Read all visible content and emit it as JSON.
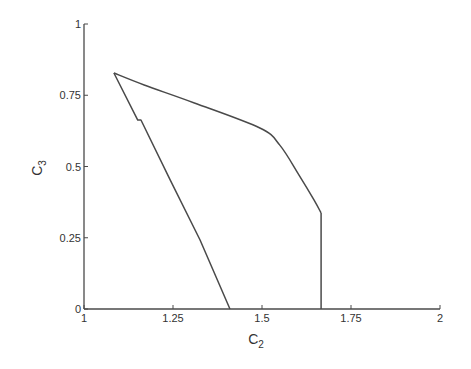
{
  "chart_data": {
    "type": "line",
    "title": "",
    "xlabel": "C2",
    "xlabel_main": "C",
    "xlabel_sub": "2",
    "ylabel": "C3",
    "ylabel_main": "C",
    "ylabel_sub": "3",
    "xlim": [
      1,
      2
    ],
    "ylim": [
      0,
      1
    ],
    "grid": false,
    "legend": null,
    "x_ticks": [
      1,
      1.25,
      1.5,
      1.75,
      2
    ],
    "x_tick_labels": [
      "1",
      "1.25",
      "1.5",
      "1.75",
      "2"
    ],
    "y_ticks": [
      0,
      0.25,
      0.5,
      0.75,
      1
    ],
    "y_tick_labels": [
      "0",
      "0.25",
      "0.5",
      "0.75",
      "1"
    ],
    "series": [
      {
        "name": "lower-left boundary",
        "x": [
          1.41,
          1.326,
          1.242,
          1.242,
          1.16,
          1.151,
          1.084
        ],
        "y": [
          0.0,
          0.242,
          0.453,
          0.453,
          0.663,
          0.663,
          0.828
        ]
      },
      {
        "name": "upper boundary curve",
        "x": [
          1.084,
          1.169,
          1.31,
          1.494,
          1.55,
          1.604,
          1.646,
          1.666
        ],
        "y": [
          0.828,
          0.786,
          0.723,
          0.635,
          0.575,
          0.47,
          0.383,
          0.337
        ]
      },
      {
        "name": "right vertical boundary",
        "x": [
          1.666,
          1.666
        ],
        "y": [
          0.337,
          0.0
        ]
      }
    ],
    "key_points": {
      "apex": [
        1.084,
        0.828
      ],
      "kink": [
        1.666,
        0.337
      ],
      "left_x_intercept": [
        1.41,
        0.0
      ],
      "right_x_intercept": [
        1.666,
        0.0
      ]
    }
  },
  "style": {
    "line_color": "#4a4a4a",
    "axis_color": "#4a4a4a",
    "text_color": "#333333",
    "background": "#ffffff"
  }
}
